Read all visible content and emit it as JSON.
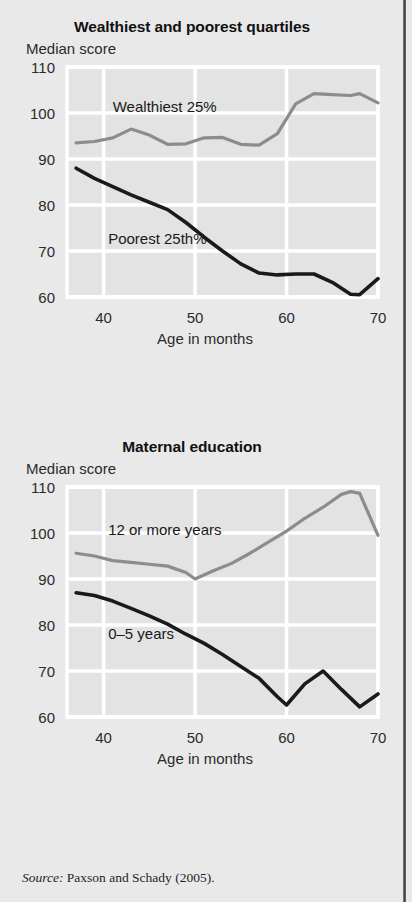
{
  "source_note": {
    "prefix": "Source:",
    "text": " Paxson and Schady (2005)."
  },
  "colors": {
    "page_background": "#e9e9e9",
    "plot_background": "#e3e3e3",
    "gridline": "#ffffff",
    "series_gray": "#8c8c8c",
    "series_black": "#1a1a1a",
    "text": "#1a1a1a"
  },
  "chart_data": [
    {
      "type": "line",
      "title": "Wealthiest and poorest quartiles",
      "ylabel": "Median score",
      "xlabel": "Age in months",
      "xlim": [
        36,
        70
      ],
      "ylim": [
        60,
        110
      ],
      "yticks": [
        60,
        70,
        80,
        90,
        100,
        110
      ],
      "xticks": [
        40,
        50,
        60,
        70
      ],
      "grid": true,
      "legend": "inline-labels",
      "series": [
        {
          "name": "Wealthiest 25%",
          "color": "#8c8c8c",
          "label_x": 41,
          "label_y": 100.2,
          "x": [
            37,
            39,
            41,
            43,
            45,
            47,
            49,
            51,
            53,
            55,
            57,
            59,
            61,
            63,
            65,
            67,
            68,
            70
          ],
          "values": [
            93.5,
            93.8,
            94.6,
            96.5,
            95.2,
            93.2,
            93.3,
            94.6,
            94.7,
            93.2,
            93.0,
            95.5,
            102.0,
            104.2,
            104.0,
            103.8,
            104.2,
            102.2
          ]
        },
        {
          "name": "Poorest 25th%",
          "color": "#1a1a1a",
          "label_x": 40.5,
          "label_y": 71.5,
          "x": [
            37,
            39,
            41,
            43,
            45,
            47,
            49,
            51,
            53,
            55,
            57,
            59,
            61,
            63,
            65,
            67,
            68,
            70
          ],
          "values": [
            88.0,
            85.8,
            84.0,
            82.2,
            80.6,
            79.0,
            76.2,
            73.0,
            70.0,
            67.2,
            65.2,
            64.8,
            65.0,
            65.0,
            63.2,
            60.6,
            60.5,
            64.0
          ]
        }
      ]
    },
    {
      "type": "line",
      "title": "Maternal education",
      "ylabel": "Median score",
      "xlabel": "Age in months",
      "xlim": [
        36,
        70
      ],
      "ylim": [
        60,
        110
      ],
      "yticks": [
        60,
        70,
        80,
        90,
        100,
        110
      ],
      "xticks": [
        40,
        50,
        60,
        70
      ],
      "grid": true,
      "legend": "inline-labels",
      "series": [
        {
          "name": "12 or more years",
          "color": "#8c8c8c",
          "label_x": 40.5,
          "label_y": 99.6,
          "x": [
            37,
            39,
            41,
            43,
            45,
            47,
            49,
            50,
            52,
            54,
            56,
            58,
            60,
            62,
            64,
            66,
            67,
            68,
            70
          ],
          "values": [
            95.6,
            95.0,
            94.0,
            93.6,
            93.2,
            92.8,
            91.4,
            90.0,
            91.8,
            93.4,
            95.6,
            98.0,
            100.4,
            103.2,
            105.6,
            108.4,
            109.0,
            108.6,
            99.5
          ]
        },
        {
          "name": "0–5 years",
          "color": "#1a1a1a",
          "label_x": 40.5,
          "label_y": 77.0,
          "x": [
            37,
            39,
            41,
            43,
            45,
            47,
            49,
            51,
            53,
            55,
            57,
            59,
            60,
            62,
            64,
            66,
            68,
            70
          ],
          "values": [
            87.0,
            86.4,
            85.2,
            83.6,
            82.0,
            80.2,
            78.0,
            76.0,
            73.6,
            71.0,
            68.4,
            64.4,
            62.6,
            67.2,
            70.0,
            66.0,
            62.2,
            65.0
          ]
        }
      ]
    }
  ]
}
